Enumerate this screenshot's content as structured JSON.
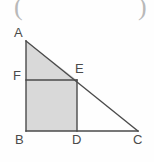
{
  "figure": {
    "type": "geometry-diagram",
    "background_color": "#fefefe",
    "stroke_color": "#4a4a4a",
    "shade_color": "#d9d9d9",
    "stroke_width": 1.4,
    "vertices": [
      {
        "id": "A",
        "label": "A",
        "x": 26,
        "y": 41,
        "label_x": 14,
        "label_y": 26
      },
      {
        "id": "F",
        "label": "F",
        "x": 26,
        "y": 80,
        "label_x": 13,
        "label_y": 69
      },
      {
        "id": "E",
        "label": "E",
        "x": 77,
        "y": 80,
        "label_x": 75,
        "label_y": 62
      },
      {
        "id": "B",
        "label": "B",
        "x": 26,
        "y": 131,
        "label_x": 15,
        "label_y": 133
      },
      {
        "id": "D",
        "label": "D",
        "x": 77,
        "y": 131,
        "label_x": 72,
        "label_y": 133
      },
      {
        "id": "C",
        "label": "C",
        "x": 138,
        "y": 131,
        "label_x": 133,
        "label_y": 133
      }
    ],
    "shaded_regions": [
      {
        "name": "triangle-AFE",
        "points": "26,41 26,80 77,80"
      },
      {
        "name": "rectangle-FBDE",
        "points": "26,80 77,80 77,131 26,131"
      }
    ],
    "segments": [
      {
        "name": "side-AB",
        "x1": 26,
        "y1": 41,
        "x2": 26,
        "y2": 131
      },
      {
        "name": "side-BC",
        "x1": 26,
        "y1": 131,
        "x2": 138,
        "y2": 131
      },
      {
        "name": "side-AC-hypotenuse",
        "x1": 26,
        "y1": 41,
        "x2": 138,
        "y2": 131
      },
      {
        "name": "segment-FE",
        "x1": 26,
        "y1": 80,
        "x2": 77,
        "y2": 80
      },
      {
        "name": "segment-ED",
        "x1": 77,
        "y1": 80,
        "x2": 77,
        "y2": 131
      }
    ],
    "marginalia": [
      {
        "name": "left-paren-fragment",
        "glyph": "(",
        "x": 14,
        "y": -6
      },
      {
        "name": "right-paren-fragment",
        "glyph": ")",
        "x": 138,
        "y": -6
      }
    ]
  }
}
